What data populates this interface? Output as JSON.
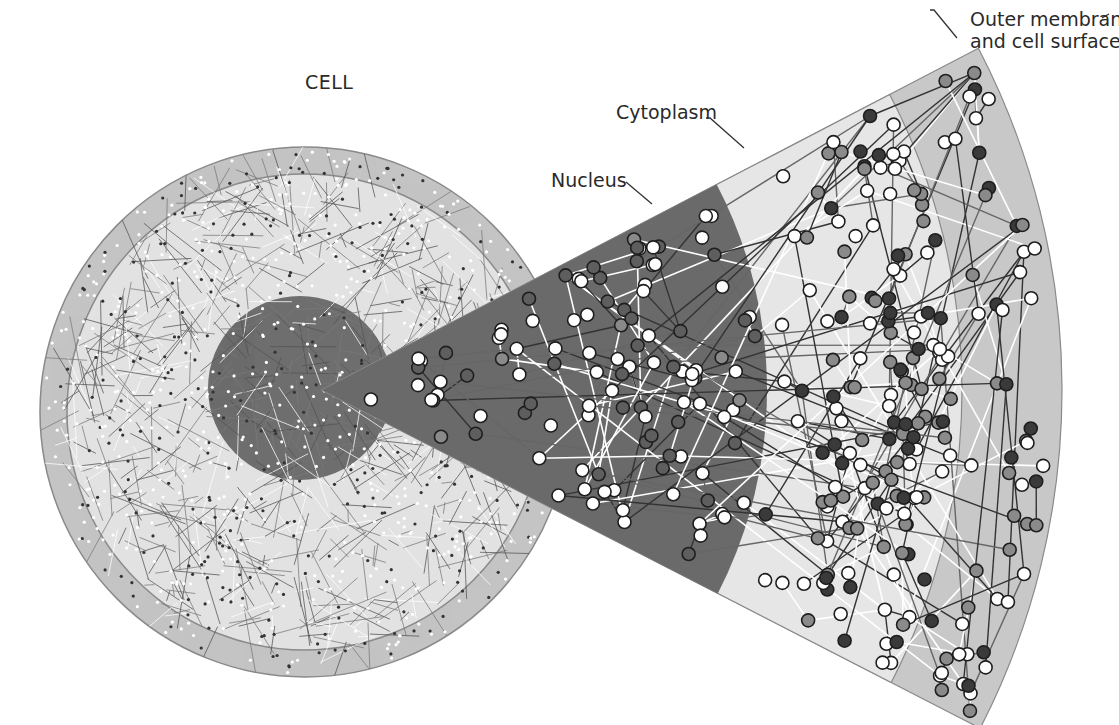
{
  "figure": {
    "type": "schematic diagram of cellular interaction network",
    "labels": {
      "cell": "CELL",
      "nucleus": "Nucleus",
      "cytoplasm": "Cytoplasm",
      "outer_membrane_line1": "Outer membrane",
      "outer_membrane_line2": "and cell surface"
    }
  },
  "colors": {
    "background": "#ffffff",
    "cell_outer_ring": "#c4c4c4",
    "cell_cytoplasm": "#e2e2e2",
    "cell_nucleus": "#6e6e6e",
    "wedge_nucleus": "#6a6a6a",
    "wedge_cytoplasm": "#e6e6e6",
    "wedge_membrane": "#c8c8c8",
    "boundary_line": "#7a7a7a",
    "node_white": "#ffffff",
    "node_mid": "#8a8a8a",
    "node_dark": "#3a3a3a",
    "edge_dark": "#333333",
    "edge_mid": "#666666",
    "edge_white": "#ffffff",
    "label_text": "#2a2a2a",
    "leader_line": "#333333"
  },
  "geometry": {
    "cell_center": [
      305,
      412
    ],
    "cell_outer_radius": 265,
    "cell_membrane_inner_radius": 238,
    "cell_nucleus_center": [
      300,
      388
    ],
    "cell_nucleus_radius": 92,
    "wedge_apex": [
      322,
      390
    ],
    "wedge_angle_start_deg": -27.5,
    "wedge_angle_end_deg": 27.2,
    "nucleus_arc_radius": 445,
    "cytoplasm_arc_radius": 640,
    "outer_arc_radius": 740
  }
}
